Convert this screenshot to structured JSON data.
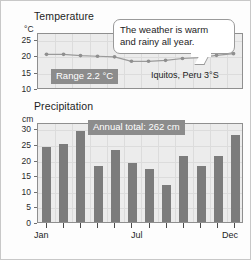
{
  "temperature": {
    "title": "Temperature",
    "unit": "°C",
    "yticks": [
      "25",
      "20",
      "15",
      "10"
    ],
    "range_badge": "Range 2.2 °C",
    "location": "Iquitos, Peru 3°S"
  },
  "precipitation": {
    "title": "Precipitation",
    "unit": "cm",
    "yticks": [
      "30",
      "25",
      "20",
      "15",
      "10",
      "5",
      "0"
    ],
    "annual_badge": "Annual total: 262 cm"
  },
  "callout": {
    "line1": "The weather is warm",
    "line2": "and rainy all year."
  },
  "xaxis": {
    "jan": "Jan",
    "jul": "Jul",
    "dec": "Dec"
  },
  "colors": {
    "bar": "#7c7c7c",
    "plot_background": "#ececec",
    "badge": "#8c8c8c",
    "line": "#9a9a9a"
  },
  "chart_data": [
    {
      "type": "line",
      "title": "Temperature",
      "xlabel": "",
      "ylabel": "°C",
      "categories": [
        "Jan",
        "Feb",
        "Mar",
        "Apr",
        "May",
        "Jun",
        "Jul",
        "Aug",
        "Sep",
        "Oct",
        "Nov",
        "Dec"
      ],
      "values": [
        20.6,
        20.6,
        20.2,
        20.0,
        19.8,
        18.4,
        18.4,
        18.7,
        19.3,
        19.6,
        20.3,
        20.8
      ],
      "ylim": [
        10,
        27
      ],
      "yticks": [
        25,
        20,
        15,
        10
      ],
      "grid": true,
      "annotations": [
        "Range 2.2 °C",
        "Iquitos, Peru 3°S",
        "The weather is warm and rainy all year."
      ]
    },
    {
      "type": "bar",
      "title": "Precipitation",
      "xlabel": "",
      "ylabel": "cm",
      "categories": [
        "Jan",
        "Feb",
        "Mar",
        "Apr",
        "May",
        "Jun",
        "Jul",
        "Aug",
        "Sep",
        "Oct",
        "Nov",
        "Dec"
      ],
      "values": [
        24,
        25,
        29,
        18,
        23,
        19,
        17,
        12,
        21,
        18,
        21,
        28
      ],
      "ylim": [
        0,
        32
      ],
      "yticks": [
        0,
        5,
        10,
        15,
        20,
        25,
        30
      ],
      "grid": true,
      "annotations": [
        "Annual total: 262 cm"
      ]
    }
  ]
}
